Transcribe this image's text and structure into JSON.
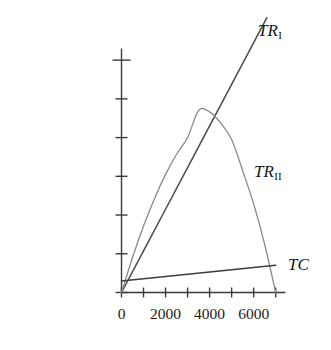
{
  "chart_data": {
    "type": "line",
    "title": "",
    "xlabel": "",
    "ylabel": "",
    "xlim": [
      0,
      7400
    ],
    "ylim": [
      0,
      12600000
    ],
    "grid": false,
    "legend_position": "inline-at-curve-end",
    "x_ticks": [
      0,
      1000,
      2000,
      3000,
      4000,
      5000,
      6000,
      7000
    ],
    "x_tick_labels": [
      "0",
      "",
      "2000",
      "",
      "4000",
      "",
      "6000",
      ""
    ],
    "y_ticks": [
      0,
      2000000,
      4000000,
      6000000,
      8000000,
      10000000,
      12000000
    ],
    "y_tick_labels": [
      "0",
      "2 000 000",
      "4 000 000",
      "6 000 000",
      "8 000 000",
      "10 000 000",
      "12 000 000"
    ],
    "series": [
      {
        "name": "TR_I",
        "label": "TR",
        "label_subscript": "I",
        "type": "line",
        "color": "#4a4a4a",
        "x": [
          0,
          1000,
          2000,
          3000,
          4000,
          5000,
          6000,
          6600
        ],
        "values": [
          0,
          2150000,
          4300000,
          6450000,
          8600000,
          10750000,
          12900000,
          14190000
        ]
      },
      {
        "name": "TR_II",
        "label": "TR",
        "label_subscript": "II",
        "type": "line",
        "color": "#8a8a8a",
        "x": [
          0,
          500,
          1000,
          1500,
          2000,
          2500,
          3000,
          3500,
          4000,
          4500,
          5000,
          5500,
          6000,
          6500,
          7000
        ],
        "values": [
          0,
          1810000,
          3430000,
          4860000,
          6100000,
          7140000,
          8000000,
          9400000,
          9330000,
          8760000,
          7900000,
          6290000,
          4570000,
          2480000,
          0
        ]
      },
      {
        "name": "TC",
        "label": "TC",
        "label_subscript": "",
        "type": "line",
        "color": "#3d3d3d",
        "x": [
          0,
          1000,
          2000,
          3000,
          4000,
          5000,
          6000,
          7000
        ],
        "values": [
          600000,
          715000,
          830000,
          945000,
          1060000,
          1175000,
          1290000,
          1405000
        ]
      }
    ]
  },
  "axes": {
    "y_axis_name": "value-axis",
    "x_axis_name": "quantity-axis"
  }
}
